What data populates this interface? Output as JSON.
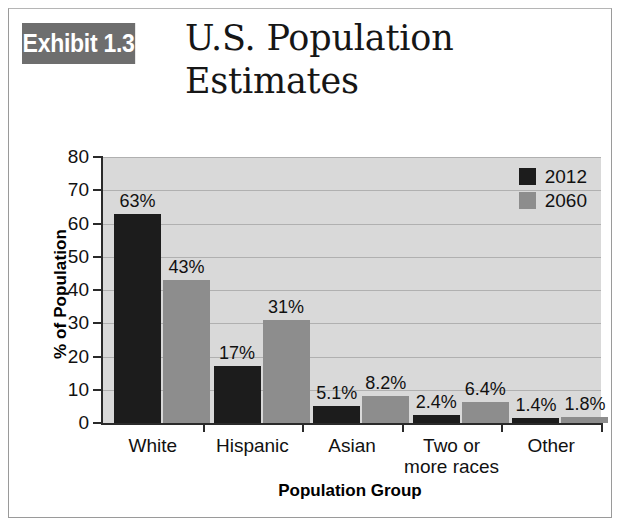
{
  "exhibit": {
    "badge_label": "Exhibit 1.3",
    "title_line1": "U.S. Population",
    "title_line2": "Estimates"
  },
  "colors": {
    "badge_bg": "#6e6e6e",
    "series_2012": "#1c1c1c",
    "series_2060": "#8d8d8d",
    "plot_bg": "#d9d9d9",
    "gridline": "#b0b0b0",
    "axis": "#2a2a2a"
  },
  "chart_data": {
    "type": "bar",
    "title": "U.S. Population Estimates",
    "xlabel": "Population Group",
    "ylabel": "% of Population",
    "ylim": [
      0,
      80
    ],
    "yticks": [
      0,
      10,
      20,
      30,
      40,
      50,
      60,
      70,
      80
    ],
    "ytick_labels": [
      "0",
      "10",
      "20",
      "30",
      "40",
      "50",
      "60",
      "70",
      "80"
    ],
    "grid": true,
    "legend_position": "top-right",
    "categories": [
      "White",
      "Hispanic",
      "Asian",
      "Two or\nmore races",
      "Other"
    ],
    "category_lines": [
      {
        "line1": "White",
        "line2": ""
      },
      {
        "line1": "Hispanic",
        "line2": ""
      },
      {
        "line1": "Asian",
        "line2": ""
      },
      {
        "line1": "Two or",
        "line2": "more races"
      },
      {
        "line1": "Other",
        "line2": ""
      }
    ],
    "series": [
      {
        "name": "2012",
        "color": "#1c1c1c",
        "values": [
          63,
          17,
          5.1,
          2.4,
          1.4
        ],
        "data_labels": [
          "63%",
          "17%",
          "5.1%",
          "2.4%",
          "1.4%"
        ]
      },
      {
        "name": "2060",
        "color": "#8d8d8d",
        "values": [
          43,
          31,
          8.2,
          6.4,
          1.8
        ],
        "data_labels": [
          "43%",
          "31%",
          "8.2%",
          "6.4%",
          "1.8%"
        ]
      }
    ]
  }
}
